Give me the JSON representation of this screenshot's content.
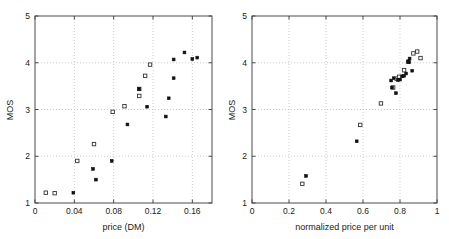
{
  "figure": {
    "background": "#ffffff",
    "axis_color": "#4a4a4a",
    "grid_color": "#b9b9b9",
    "filled_marker_color": "#111111",
    "open_marker_color": "#333333"
  },
  "chart_data": [
    {
      "type": "scatter",
      "panel": "left",
      "title": "",
      "xlabel": "price (DM)",
      "ylabel": "MOS",
      "xlim": [
        0,
        0.18
      ],
      "ylim": [
        1,
        5
      ],
      "xticks": [
        0,
        0.04,
        0.08,
        0.12,
        0.16
      ],
      "xticklabels": [
        "0",
        "0.04",
        "0.08",
        "0.12",
        "0.16"
      ],
      "yticks": [
        1,
        2,
        3,
        4,
        5
      ],
      "yticklabels": [
        "1",
        "2",
        "3",
        "4",
        "5"
      ],
      "grid": true,
      "legend": "none",
      "series": [
        {
          "name": "open-square",
          "marker": "open-square",
          "points": [
            [
              0.011,
              1.22
            ],
            [
              0.02,
              1.21
            ],
            [
              0.043,
              1.9
            ],
            [
              0.06,
              2.26
            ],
            [
              0.079,
              2.95
            ],
            [
              0.091,
              3.07
            ],
            [
              0.106,
              3.44
            ],
            [
              0.106,
              3.29
            ],
            [
              0.112,
              3.72
            ],
            [
              0.117,
              3.96
            ]
          ]
        },
        {
          "name": "filled-square",
          "marker": "filled-square",
          "points": [
            [
              0.039,
              1.22
            ],
            [
              0.059,
              1.73
            ],
            [
              0.062,
              1.5
            ],
            [
              0.078,
              1.9
            ],
            [
              0.094,
              2.68
            ],
            [
              0.106,
              3.44
            ],
            [
              0.114,
              3.06
            ],
            [
              0.133,
              2.85
            ],
            [
              0.136,
              3.24
            ],
            [
              0.141,
              3.67
            ],
            [
              0.141,
              4.07
            ],
            [
              0.152,
              4.22
            ],
            [
              0.16,
              4.08
            ],
            [
              0.165,
              4.11
            ]
          ]
        }
      ]
    },
    {
      "type": "scatter",
      "panel": "right",
      "title": "",
      "xlabel": "normalized price per unit",
      "ylabel": "MOS",
      "xlim": [
        0,
        1
      ],
      "ylim": [
        1,
        5
      ],
      "xticks": [
        0,
        0.2,
        0.4,
        0.6,
        0.8,
        1
      ],
      "xticklabels": [
        "0",
        "0.2",
        "0.4",
        "0.6",
        "0.8",
        "1"
      ],
      "yticks": [
        1,
        2,
        3,
        4,
        5
      ],
      "yticklabels": [
        "1",
        "2",
        "3",
        "4",
        "5"
      ],
      "grid": true,
      "legend": "none",
      "series": [
        {
          "name": "open-square",
          "marker": "open-square",
          "points": [
            [
              0.272,
              1.41
            ],
            [
              0.585,
              2.67
            ],
            [
              0.697,
              3.13
            ],
            [
              0.763,
              3.47
            ],
            [
              0.782,
              3.66
            ],
            [
              0.795,
              3.7
            ],
            [
              0.822,
              3.84
            ],
            [
              0.845,
              4.02
            ],
            [
              0.872,
              4.2
            ],
            [
              0.893,
              4.24
            ],
            [
              0.911,
              4.1
            ]
          ]
        },
        {
          "name": "filled-square",
          "marker": "filled-square",
          "points": [
            [
              0.292,
              1.58
            ],
            [
              0.566,
              2.32
            ],
            [
              0.752,
              3.62
            ],
            [
              0.757,
              3.47
            ],
            [
              0.766,
              3.67
            ],
            [
              0.778,
              3.35
            ],
            [
              0.789,
              3.63
            ],
            [
              0.8,
              3.64
            ],
            [
              0.812,
              3.71
            ],
            [
              0.822,
              3.72
            ],
            [
              0.833,
              3.77
            ],
            [
              0.845,
              4.03
            ],
            [
              0.848,
              4.01
            ],
            [
              0.852,
              4.09
            ],
            [
              0.866,
              3.83
            ]
          ]
        }
      ]
    }
  ]
}
